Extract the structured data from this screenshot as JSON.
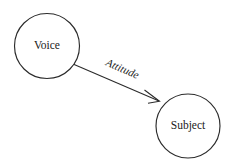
{
  "diagram": {
    "type": "node-link-diagram",
    "background_color": "#ffffff",
    "stroke_color": "#2b2b2b",
    "text_color": "#1a1a1a",
    "nodes": [
      {
        "id": "voice",
        "label": "Voice",
        "shape": "circle",
        "cx": 47,
        "cy": 46,
        "r": 32.5
      },
      {
        "id": "subject",
        "label": "Subject",
        "shape": "circle",
        "cx": 188,
        "cy": 126,
        "r": 32
      }
    ],
    "edges": [
      {
        "id": "voice-to-subject",
        "label": "Attitude",
        "from": "voice",
        "to": "subject",
        "directed": true,
        "x1": 73,
        "y1": 64,
        "x2": 159,
        "y2": 101,
        "label_x": 121,
        "label_y": 72,
        "label_rotation": 24
      }
    ]
  }
}
